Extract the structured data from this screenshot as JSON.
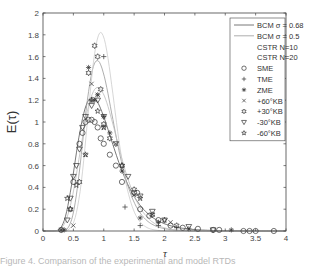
{
  "chart_data": {
    "type": "scatter",
    "title": "",
    "xlabel": "τ",
    "ylabel": "E(τ)",
    "xlim": [
      0,
      4
    ],
    "ylim": [
      0,
      2
    ],
    "xticks": [
      "0",
      "0.5",
      "1",
      "1.5",
      "2",
      "2.5",
      "3",
      "3.5",
      "4"
    ],
    "yticks": [
      "0",
      "0.2",
      "0.4",
      "0.6",
      "0.8",
      "1",
      "1.2",
      "1.4",
      "1.6",
      "1.8",
      "2"
    ],
    "grid": false,
    "legend_position": "upper right",
    "series": [
      {
        "name": "BCM σ = 0.68",
        "kind": "line",
        "sigma": 0.68,
        "color": "#555555"
      },
      {
        "name": "BCM σ = 0.5",
        "kind": "line",
        "sigma": 0.5,
        "color": "#999999"
      },
      {
        "name": "CSTR N=10",
        "kind": "line",
        "N": 10,
        "color": "#bbbbbb"
      },
      {
        "name": "CSTR N=20",
        "kind": "line",
        "N": 20,
        "color": "#cccccc"
      },
      {
        "name": "SME",
        "kind": "marker",
        "marker": "circle",
        "x": [
          0.3,
          0.5,
          0.6,
          0.65,
          0.7,
          0.75,
          0.8,
          0.85,
          0.9,
          0.95,
          1.0,
          1.1,
          1.2,
          1.3,
          1.5,
          1.55,
          1.6,
          1.75,
          1.9,
          2.1,
          2.3,
          2.55,
          2.8,
          2.9,
          3.3,
          3.4,
          3.5,
          3.8
        ],
        "y": [
          0.01,
          0.45,
          0.8,
          0.9,
          1.0,
          1.02,
          1.02,
          1.0,
          0.95,
          0.85,
          0.8,
          0.7,
          0.6,
          0.45,
          0.35,
          0.35,
          0.2,
          0.14,
          0.1,
          0.05,
          0.03,
          0.02,
          0.01,
          0.01,
          0.0,
          0.0,
          0.0,
          0.0
        ]
      },
      {
        "name": "TME",
        "kind": "marker",
        "marker": "plus",
        "x": [
          0.3,
          0.8,
          1.0,
          1.35,
          1.6,
          1.9,
          2.2
        ],
        "y": [
          0.01,
          1.2,
          1.6,
          0.22,
          0.05,
          0.05,
          0.03
        ]
      },
      {
        "name": "ZME",
        "kind": "marker",
        "marker": "asterisk",
        "x": [
          0.35,
          0.75,
          0.85,
          0.9,
          1.0,
          1.1,
          1.3,
          1.6,
          1.9,
          2.4,
          3.1
        ],
        "y": [
          0.01,
          1.5,
          1.2,
          1.25,
          1.05,
          0.9,
          0.55,
          0.12,
          0.08,
          0.02,
          0.01
        ]
      },
      {
        "name": "+60°KB",
        "kind": "marker",
        "marker": "x",
        "x": [
          0.3,
          0.5,
          0.7,
          0.8,
          0.9,
          1.0,
          1.2,
          1.5,
          1.8,
          2.1
        ],
        "y": [
          0.01,
          0.05,
          0.7,
          1.35,
          1.25,
          0.95,
          0.8,
          0.33,
          0.15,
          0.08
        ]
      },
      {
        "name": "+30°KB",
        "kind": "marker",
        "marker": "hexagram",
        "x": [
          0.45,
          0.6,
          0.75,
          0.85,
          0.9,
          0.95,
          1.0,
          1.1,
          1.3,
          1.5,
          1.8,
          2.2
        ],
        "y": [
          0.2,
          0.45,
          1.45,
          1.7,
          1.6,
          1.3,
          0.98,
          0.85,
          0.6,
          0.38,
          0.15,
          0.05
        ]
      },
      {
        "name": "-30°KB",
        "kind": "marker",
        "marker": "triangle-down",
        "x": [
          0.4,
          0.45,
          0.5,
          0.55,
          0.6,
          0.65,
          0.7,
          0.8,
          0.9,
          1.0,
          1.2,
          1.4,
          1.6,
          1.8,
          2.0,
          2.4,
          2.8
        ],
        "y": [
          0.1,
          0.3,
          0.5,
          0.6,
          0.75,
          0.95,
          1.05,
          1.15,
          1.2,
          1.05,
          0.8,
          0.5,
          0.32,
          0.18,
          0.1,
          0.04,
          0.01
        ]
      },
      {
        "name": "-60°KB",
        "kind": "marker",
        "marker": "pentagram",
        "x": [
          0.4,
          0.45,
          0.55,
          0.7,
          0.8,
          0.9,
          1.0,
          1.3,
          1.6,
          2.0
        ],
        "y": [
          0.3,
          0.2,
          0.42,
          0.7,
          1.2,
          1.1,
          0.95,
          0.6,
          0.3,
          0.1
        ]
      }
    ]
  },
  "axes": {
    "xlabel": "τ",
    "ylabel": "E(τ)"
  },
  "caption": "Figure 4. Comparison of the experimental and model RTDs"
}
